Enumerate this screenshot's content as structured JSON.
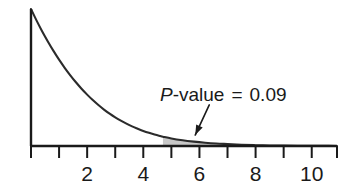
{
  "figure": {
    "background_color": "#ffffff",
    "axis_color": "#1a1a1a",
    "curve_color": "#2b2b2b",
    "shade_color": "#c8c8c8",
    "text_color": "#1a1a1a"
  },
  "annotation": {
    "symbol": "P",
    "label_rest": "-value",
    "equals": "=",
    "value": "0.09",
    "full_text": "P-value = 0.09"
  },
  "chart_data": {
    "type": "area",
    "title": "",
    "subtitle": "",
    "xlabel": "",
    "ylabel": "",
    "xlim": [
      0,
      10.9
    ],
    "ylim": [
      0,
      1
    ],
    "grid": false,
    "legend": null,
    "x_ticks_major": [
      2,
      4,
      6,
      8,
      10
    ],
    "x_tick_labels": [
      "2",
      "4",
      "6",
      "8",
      "10"
    ],
    "x_ticks_minor": [
      0,
      1,
      3,
      5,
      7,
      9
    ],
    "y_axis_visible": true,
    "y_ticks": [],
    "shaded_region": {
      "label": "P-value = 0.09",
      "area": 0.09,
      "x_start": 4.7,
      "x_end": 10.9,
      "fill": "#c8c8c8"
    },
    "curve": {
      "name": "density",
      "x": [
        0.0,
        0.2,
        0.4,
        0.6,
        0.8,
        1.0,
        1.2,
        1.4,
        1.6,
        1.8,
        2.0,
        2.2,
        2.4,
        2.6,
        2.8,
        3.0,
        3.2,
        3.4,
        3.6,
        3.8,
        4.0,
        4.2,
        4.4,
        4.6,
        4.7,
        5.0,
        5.4,
        5.8,
        6.2,
        6.6,
        7.0,
        7.5,
        8.0,
        8.5,
        9.0,
        9.5,
        10.0,
        10.5,
        10.9
      ],
      "y": [
        1.0,
        0.915,
        0.836,
        0.763,
        0.694,
        0.63,
        0.571,
        0.516,
        0.465,
        0.418,
        0.375,
        0.335,
        0.299,
        0.266,
        0.236,
        0.209,
        0.185,
        0.163,
        0.143,
        0.126,
        0.11,
        0.096,
        0.084,
        0.073,
        0.068,
        0.055,
        0.042,
        0.032,
        0.024,
        0.018,
        0.014,
        0.009,
        0.006,
        0.004,
        0.003,
        0.002,
        0.001,
        0.001,
        0.0
      ]
    },
    "arrow": {
      "from_x": 6.35,
      "from_y": 0.3,
      "to_x": 5.85,
      "to_y": 0.08
    }
  },
  "icons": {
    "arrow": "arrow-pointer-icon"
  }
}
